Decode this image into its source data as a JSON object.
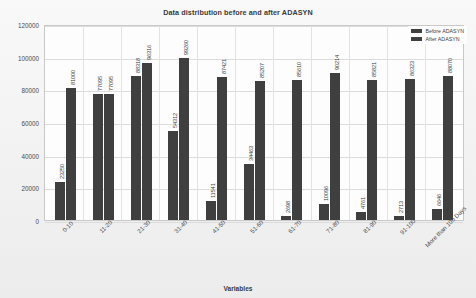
{
  "chart_data": {
    "type": "bar",
    "title": "Data distribution before and after ADASYN",
    "xlabel": "Variables",
    "ylabel": "",
    "ylim": [
      0,
      120000
    ],
    "ytick_labels": [
      "120000",
      "100000",
      "80000",
      "60000",
      "40000",
      "20000",
      "0"
    ],
    "ytick_values": [
      120000,
      100000,
      80000,
      60000,
      40000,
      20000,
      0
    ],
    "grid": true,
    "legend_position": "top-right",
    "categories": [
      "0-10",
      "11-20",
      "21-30",
      "31-40",
      "41-50",
      "51-60",
      "61-70",
      "71-80",
      "81-90",
      "91-100",
      "More than 100 Days"
    ],
    "series": [
      {
        "name": "Before ADASYN",
        "color": "#3f3f3f",
        "values": [
          23250,
          77095,
          88318,
          54312,
          11541,
          34463,
          2698,
          10096,
          4761,
          2713,
          6646
        ]
      },
      {
        "name": "After ADASYN",
        "color": "#3f3f3f",
        "values": [
          81000,
          77095,
          96316,
          99260,
          87421,
          85207,
          85610,
          90214,
          85821,
          86323,
          88070
        ]
      }
    ],
    "bar_labels": [
      [
        "23250",
        "81000"
      ],
      [
        "77095",
        "77095"
      ],
      [
        "88318",
        "96316"
      ],
      [
        "54312",
        "99260"
      ],
      [
        "11541",
        "87421"
      ],
      [
        "34463",
        "85207"
      ],
      [
        "2698",
        "85610"
      ],
      [
        "10096",
        "90214"
      ],
      [
        "4761",
        "85821"
      ],
      [
        "2713",
        "86323"
      ],
      [
        "6646",
        "88070"
      ]
    ]
  },
  "legend": {
    "items": [
      {
        "label": "Before ADASYN"
      },
      {
        "label": "After ADASYN"
      }
    ]
  }
}
